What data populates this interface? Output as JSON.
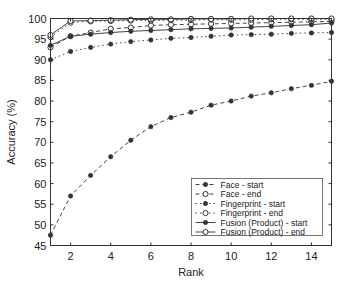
{
  "chart_data": {
    "type": "line",
    "title": "",
    "xlabel": "Rank",
    "ylabel": "Accuracy (%)",
    "xlim": [
      1,
      15
    ],
    "ylim": [
      45,
      100
    ],
    "x": [
      1,
      2,
      3,
      4,
      5,
      6,
      7,
      8,
      9,
      10,
      11,
      12,
      13,
      14,
      15
    ],
    "xticks": [
      2,
      4,
      6,
      8,
      10,
      12,
      14
    ],
    "yticks": [
      45,
      50,
      55,
      60,
      65,
      70,
      75,
      80,
      85,
      90,
      95,
      100
    ],
    "grid": false,
    "legend_position": "lower right",
    "series": [
      {
        "name": "Face - start",
        "line": "dashed",
        "marker": "filled",
        "values": [
          47.5,
          57,
          62,
          66.5,
          70.5,
          73.8,
          76,
          77.3,
          79,
          80,
          81.2,
          82,
          83,
          83.8,
          84.8
        ]
      },
      {
        "name": "Face - end",
        "line": "dashed",
        "marker": "open",
        "values": [
          93,
          95.7,
          96.6,
          97.5,
          97.8,
          98.3,
          98.5,
          98.6,
          98.7,
          98.8,
          98.9,
          99,
          99.1,
          99.2,
          99.3
        ]
      },
      {
        "name": "Fingerprint - start",
        "line": "dotted",
        "marker": "filled",
        "values": [
          90,
          92,
          93,
          93.8,
          94.4,
          94.8,
          95.2,
          95.4,
          95.7,
          96,
          96.1,
          96.2,
          96.4,
          96.5,
          96.6
        ]
      },
      {
        "name": "Fingerprint - end",
        "line": "dotted",
        "marker": "open",
        "values": [
          95.5,
          99,
          99.3,
          99.4,
          99.5,
          99.5,
          99.6,
          99.6,
          99.7,
          99.7,
          99.7,
          99.8,
          99.8,
          99.8,
          99.8
        ]
      },
      {
        "name": "Fusion (Product) - start",
        "line": "solid",
        "marker": "filled",
        "values": [
          93.5,
          95.7,
          96.2,
          96.6,
          96.9,
          97.1,
          97.3,
          97.5,
          97.6,
          97.7,
          97.9,
          98.1,
          98.3,
          98.5,
          98.9
        ]
      },
      {
        "name": "Fusion (Product) - end",
        "line": "solid",
        "marker": "open",
        "values": [
          96,
          99.4,
          99.5,
          99.6,
          99.7,
          99.8,
          99.8,
          99.9,
          99.9,
          99.9,
          100,
          100,
          100,
          100,
          100
        ]
      }
    ]
  }
}
